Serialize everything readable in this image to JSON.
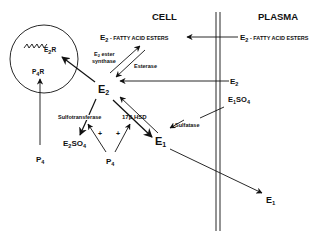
{
  "regions": {
    "cell": "CELL",
    "plasma": "PLASMA"
  },
  "molecules": {
    "e2_fae_cell": {
      "base": "E",
      "sub": "2",
      "rest": " - FATTY ACID ESTERS"
    },
    "e2_fae_plasma": {
      "base": "E",
      "sub": "2",
      "rest": " - FATTY ACID ESTERS"
    },
    "e2r": {
      "base": "E",
      "sub": "2",
      "rest": "R"
    },
    "p4r": {
      "base": "P",
      "sub": "4",
      "rest": "R"
    },
    "e2_center": {
      "base": "E",
      "sub": "2"
    },
    "e2_plasma": {
      "base": "E",
      "sub": "2"
    },
    "e1so4_plasma": {
      "base": "E",
      "sub": "1",
      "rest": "SO",
      "sub2": "4"
    },
    "e1_cell": {
      "base": "E",
      "sub": "1"
    },
    "e1_plasma": {
      "base": "E",
      "sub": "1"
    },
    "e2so4": {
      "base": "E",
      "sub": "2",
      "rest": "SO",
      "sub2": "4"
    },
    "p4_left": {
      "base": "P",
      "sub": "4"
    },
    "p4_center": {
      "base": "P",
      "sub": "4"
    }
  },
  "enzymes": {
    "ester_synthase_line1": "E",
    "ester_synthase_sub": "2",
    "ester_synthase_line1_rest": " ester",
    "ester_synthase_line2": "synthase",
    "esterase": "Esterase",
    "sulfotransferase": "Sulfotransferase",
    "hsd": "17β HSD",
    "sulfatase": "Sulfatase"
  },
  "modifiers": {
    "plus_left": "+",
    "plus_right": "+"
  },
  "colors": {
    "ink": "#111111",
    "background": "#ffffff"
  }
}
